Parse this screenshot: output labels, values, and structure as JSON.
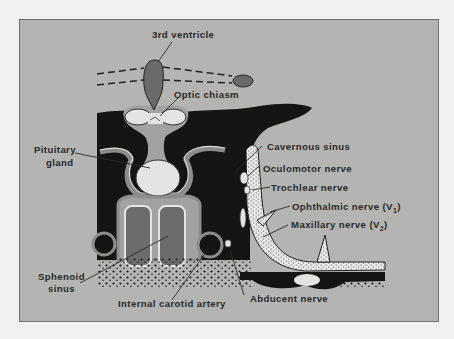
{
  "figure": {
    "colors": {
      "page": "#f1f1f0",
      "panel": "#b4b4b2",
      "panel_border": "#6f6f6e",
      "bone_dark": "#141414",
      "ventricle": "#6a6a68",
      "soft_tissue": "#a2a2a0",
      "light_structure": "#e4e4e2",
      "sinus_fill": "#6c6c6a",
      "label_text": "#2a2a2a",
      "leader_line": "#2a2a2a"
    }
  },
  "labels": {
    "third_ventricle": "3rd ventricle",
    "optic_chiasm": "Optic chiasm",
    "pituitary_gland_line1": "Pituitary",
    "pituitary_gland_line2": "gland",
    "cavernous_sinus": "Cavernous sinus",
    "oculomotor_nerve": "Oculomotor nerve",
    "trochlear_nerve": "Trochlear nerve",
    "ophthalmic_nerve": "Ophthalmic nerve (V",
    "ophthalmic_nerve_sub": "1",
    "ophthalmic_nerve_close": ")",
    "maxillary_nerve": "Maxillary nerve (V",
    "maxillary_nerve_sub": "2",
    "maxillary_nerve_close": ")",
    "sphenoid_sinus_line1": "Sphenoid",
    "sphenoid_sinus_line2": "sinus",
    "internal_carotid_artery": "Internal carotid artery",
    "abducent_nerve": "Abducent nerve"
  }
}
